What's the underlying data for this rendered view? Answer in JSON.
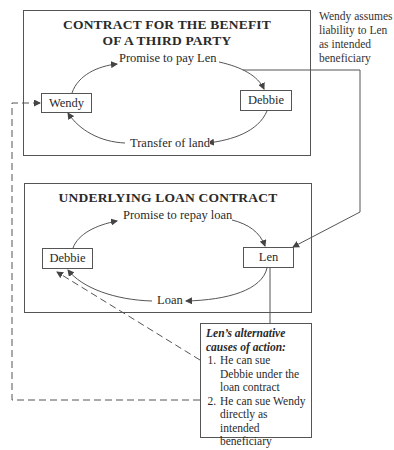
{
  "diagram": {
    "top_box": {
      "title_line1": "CONTRACT FOR THE BENEFIT",
      "title_line2": "OF A THIRD PARTY",
      "left_party": "Wendy",
      "right_party": "Debbie",
      "top_arrow_label": "Promise to pay Len",
      "bottom_arrow_label": "Transfer of land"
    },
    "side_note": {
      "line1": "Wendy assumes",
      "line2": "liability to Len",
      "line3": "as intended",
      "line4": "beneficiary"
    },
    "bottom_box": {
      "title": "UNDERLYING LOAN CONTRACT",
      "left_party": "Debbie",
      "right_party": "Len",
      "top_arrow_label": "Promise to repay loan",
      "bottom_arrow_label": "Loan"
    },
    "causes_box": {
      "heading_line1": "Len’s alternative",
      "heading_line2": "causes of action:",
      "items": [
        "He can sue Debbie under the loan contract",
        "He can sue Wendy directly as intended beneficiary"
      ]
    },
    "colors": {
      "line": "#555555",
      "text": "#2a2a2a",
      "background": "#ffffff"
    }
  }
}
